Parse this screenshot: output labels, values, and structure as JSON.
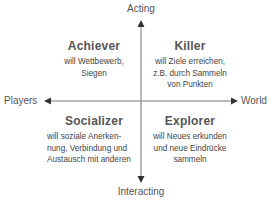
{
  "diagram": {
    "type": "quadrant",
    "colors": {
      "axis": "#666666",
      "text": "#555555",
      "background": "#ffffff"
    },
    "axes": {
      "top": "Acting",
      "bottom": "Interacting",
      "left": "Players",
      "right": "World"
    },
    "quadrants": [
      {
        "position": "top-left",
        "title": "Achiever",
        "description_lines": [
          "will Wettbewerb,",
          "Siegen"
        ]
      },
      {
        "position": "top-right",
        "title": "Killer",
        "description_lines": [
          "will Ziele erreichen,",
          "z.B. durch Sammeln",
          "von Punkten"
        ]
      },
      {
        "position": "bottom-left",
        "title": "Socializer",
        "description_lines": [
          "will soziale Anerken-",
          "nung, Verbindung und",
          "Austausch mit anderen"
        ]
      },
      {
        "position": "bottom-right",
        "title": "Explorer",
        "description_lines": [
          "will Neues erkunden",
          "und neue Eindrücke",
          "sammeln"
        ]
      }
    ]
  }
}
